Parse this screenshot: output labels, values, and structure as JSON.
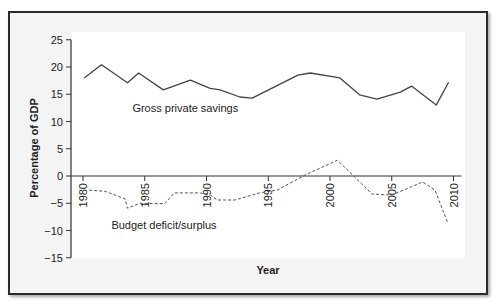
{
  "chart_data": {
    "type": "line",
    "title": "",
    "xlabel": "Year",
    "ylabel": "Percentage of GDP",
    "ylim": [
      -15,
      25
    ],
    "xlim": [
      1980,
      2010
    ],
    "yticks": [
      25,
      20,
      15,
      10,
      5,
      0,
      -5,
      -10,
      -15
    ],
    "xticks": [
      1980,
      1985,
      1990,
      1995,
      2000,
      2005,
      2010
    ],
    "grid": false,
    "legend": "inline labels",
    "series": [
      {
        "name": "Gross private savings",
        "style": "solid",
        "color": "#444444",
        "x": [
          1980.1,
          1981.5,
          1983.6,
          1984.5,
          1986.5,
          1988.7,
          1990.3,
          1991.1,
          1992.7,
          1993.7,
          1997.4,
          1998.4,
          2000.8,
          2002.4,
          2003.8,
          2005.7,
          2006.6,
          2008.6,
          2009.6
        ],
        "values": [
          18.0,
          20.4,
          17.1,
          18.9,
          15.8,
          17.6,
          16.1,
          15.8,
          14.5,
          14.3,
          18.5,
          18.9,
          18.0,
          14.9,
          14.1,
          15.4,
          16.5,
          13.0,
          17.2
        ]
      },
      {
        "name": "Budget deficit/surplus",
        "style": "dashed",
        "color": "#555555",
        "x": [
          1980.5,
          1981.8,
          1983.4,
          1983.6,
          1984.6,
          1986.6,
          1987.4,
          1989.5,
          1990.3,
          1990.9,
          1992.3,
          1994.3,
          1995.7,
          1998.0,
          2000.6,
          2003.4,
          2005.0,
          2007.5,
          2008.5,
          2009.5
        ],
        "values": [
          -2.6,
          -2.8,
          -4.2,
          -5.9,
          -5.0,
          -5.1,
          -3.1,
          -3.1,
          -3.5,
          -4.4,
          -4.4,
          -3.1,
          -2.6,
          0.2,
          2.9,
          -3.3,
          -3.5,
          -1.1,
          -2.6,
          -8.4
        ]
      }
    ],
    "annotations": [
      {
        "text": "Gross private savings",
        "x": 1984,
        "y": 11.8
      },
      {
        "text": "Budget deficit/surplus",
        "x": 1982.3,
        "y": -9.8
      }
    ]
  }
}
